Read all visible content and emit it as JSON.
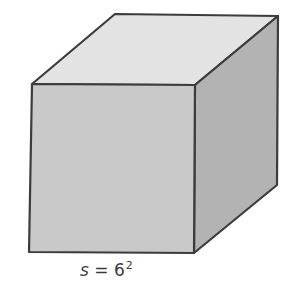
{
  "figure": {
    "shape": "cube",
    "label": {
      "variable": "s",
      "equals": " = ",
      "base": "6",
      "exponent": "2"
    },
    "colors": {
      "top_face": "#e3e3e3",
      "front_face": "#c9c9c9",
      "right_face": "#b3b3b3",
      "edge": "#3c3c3c"
    }
  }
}
